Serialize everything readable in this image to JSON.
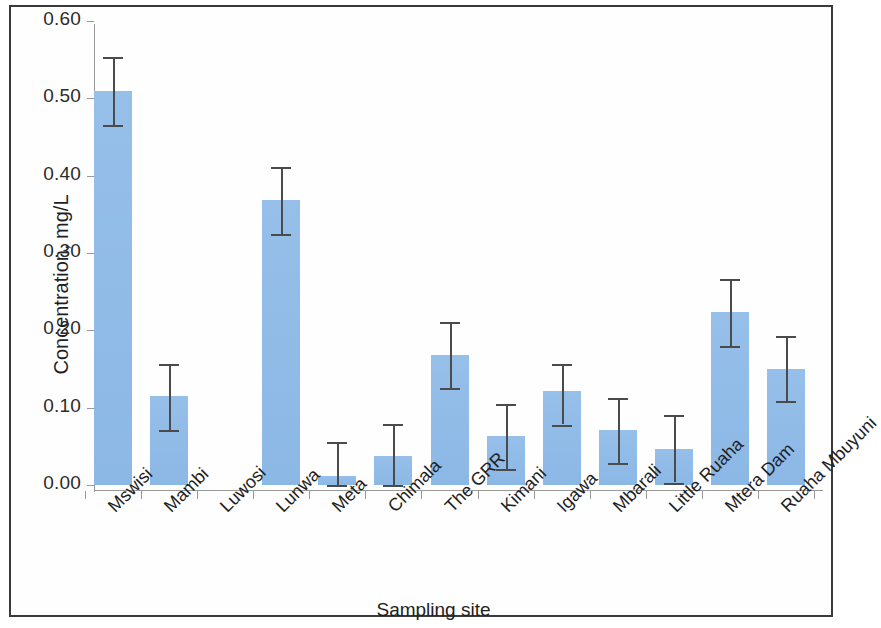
{
  "chart_data": {
    "type": "bar",
    "title": "",
    "xlabel": "Sampling site",
    "ylabel": "Concentration, mg/L",
    "ylim": [
      0.0,
      0.6
    ],
    "ytick_labels": [
      "0.00",
      "0.10",
      "0.20",
      "0.30",
      "0.40",
      "0.50",
      "0.60"
    ],
    "ytick_values": [
      0.0,
      0.1,
      0.2,
      0.3,
      0.4,
      0.5,
      0.6
    ],
    "grid": false,
    "legend": "none",
    "bar_color": "#91bce8",
    "error_bar_color": "#4b4b4b",
    "axis_color": "#9a9a9a",
    "categories": [
      "Mswisi",
      "Mambi",
      "Luwosi",
      "Lunwa",
      "Meta",
      "Chimala",
      "The GRR",
      "Kimani",
      "Igawa",
      "Mbarali",
      "Little Ruaha",
      "Mtera Dam",
      "Ruaha Mbuyuni"
    ],
    "values": [
      0.51,
      0.115,
      0.0,
      0.368,
      0.012,
      0.037,
      0.168,
      0.063,
      0.121,
      0.071,
      0.047,
      0.224,
      0.15
    ],
    "error_upper": [
      0.553,
      0.157,
      0.0,
      0.411,
      0.055,
      0.079,
      0.211,
      0.105,
      0.156,
      0.112,
      0.09,
      0.266,
      0.193
    ],
    "error_lower": [
      0.465,
      0.071,
      0.0,
      0.325,
      0.0,
      0.0,
      0.125,
      0.021,
      0.078,
      0.028,
      0.003,
      0.18,
      0.108
    ]
  },
  "figure": {
    "has_border": true,
    "background": "#ffffff"
  }
}
